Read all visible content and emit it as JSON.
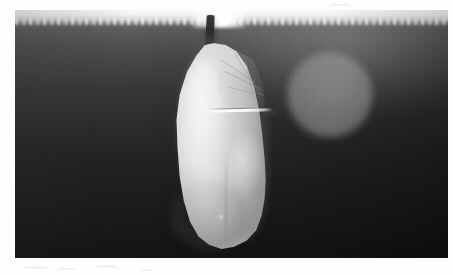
{
  "image": {
    "kind": "photograph",
    "subject": "butterfly chrysalis (pupa) hanging from a silk attachment",
    "color_mode": "grayscale",
    "orientation": "landscape",
    "alt_text": "Black and white photograph of a pale chrysalis hanging by a dark stalk from a brightly lit surface, against a dark out-of-focus background with a soft round light blur to the right.",
    "canvas": {
      "width": 453,
      "height": 275
    },
    "frame": {
      "border_color": "#fefefe",
      "photo_left": 15,
      "photo_top": 10,
      "photo_width": 433,
      "photo_height": 248
    },
    "palette": {
      "border_white": "#fefefe",
      "top_highlight": "#fafafa",
      "background_top": "#8e8e8e",
      "background_mid": "#3a3a3a",
      "background_bottom": "#151515",
      "bokeh_gray": "#b0b0b0",
      "chrysalis_highlight": "#ececea",
      "chrysalis_midtone": "#cfcfcf",
      "chrysalis_shadow": "#9a9a9a",
      "stalk_dark": "#2a2926",
      "ridge_white": "#ffffff"
    },
    "regions": [
      {
        "name": "top-highlight-band",
        "note": "overexposed lit surface strip across the top of the frame"
      },
      {
        "name": "attachment-stalk",
        "note": "dark vertical cremaster / silk stalk holding the pupa"
      },
      {
        "name": "chrysalis-body",
        "note": "pale teardrop pupa body, brightest on its left face"
      },
      {
        "name": "wing-case",
        "note": "upper-right facet of the pupa showing faint diagonal wing veins"
      },
      {
        "name": "bright-ridge",
        "note": "sharp white horizontal lip across the pupa below the wing case"
      },
      {
        "name": "bokeh-disc",
        "note": "soft circular out-of-focus light to the right of the pupa"
      },
      {
        "name": "dark-background",
        "note": "blurred background darkening from mid-gray at top to near black at bottom"
      }
    ]
  }
}
